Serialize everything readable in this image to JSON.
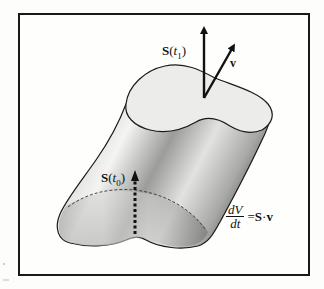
{
  "figure": {
    "labels": {
      "s_t1": {
        "vec": "S",
        "open": "(",
        "var": "t",
        "sub": "1",
        "close": ")"
      },
      "v": "v",
      "s_t0": {
        "vec": "S",
        "open": "(",
        "var": "t",
        "sub": "0",
        "close": ")"
      },
      "formula": {
        "numerator": "dV",
        "denominator": "dt",
        "equals": "=",
        "rhs_vec": "S",
        "dot": "·",
        "rhs_v": "v"
      }
    },
    "elements": {
      "cylinder": "generalized-cylinder",
      "top_cap": "surface-at-t1",
      "bottom_section": "surface-at-t0 (dashed)",
      "arrow_s_t1": "solid-vertical-arrow",
      "arrow_v": "solid-diagonal-arrow",
      "arrow_s_t0": "dashed-vertical-arrow"
    },
    "colors": {
      "frame": "#1a1a1a",
      "cap_fill": "#ececea",
      "body_dark": "#7a7a7a",
      "body_light": "#f2f2f0",
      "ink": "#111111"
    }
  }
}
